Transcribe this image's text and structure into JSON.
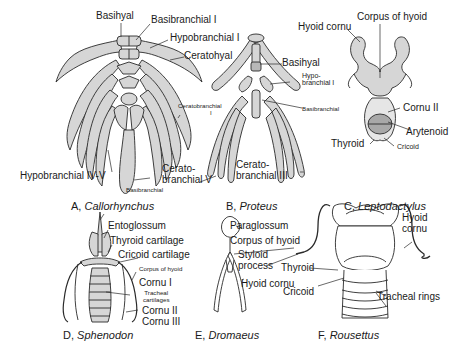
{
  "figure": {
    "panels": [
      {
        "id": "A",
        "letter": "A,",
        "taxon": "Callorhynchus",
        "labels": {
          "basihyal": "Basihyal",
          "basibranchial_i": "Basibranchial I",
          "hypobranchial_i": "Hypobranchial I",
          "ceratohyal": "Ceratohyal",
          "ceratobranchial_i_1": "Ceratobranchial",
          "ceratobranchial_i_2": "I",
          "hypobranchial_iv_v": "Hypobranchial IV-V",
          "ceratobranchial_v_1": "Cerato-",
          "ceratobranchial_v_2": "branchial V",
          "basibranchial": "Basibranchial"
        }
      },
      {
        "id": "B",
        "letter": "B,",
        "taxon": "Proteus",
        "labels": {
          "basihyal": "Basihyal",
          "hypobranchial_i_1": "Hypo-",
          "hypobranchial_i_2": "branchial I",
          "basibranchial": "Basibranchial",
          "ceratobranchial_iii_1": "Cerato-",
          "ceratobranchial_iii_2": "branchial III"
        }
      },
      {
        "id": "C",
        "letter": "C,",
        "taxon": "Leptodactylus",
        "labels": {
          "hyoid_cornu": "Hyoid cornu",
          "corpus_of_hyoid": "Corpus of hyoid",
          "cornu_ii": "Cornu II",
          "arytenoid": "Arytenoid",
          "thyroid": "Thyroid",
          "cricoid": "Cricoid"
        }
      },
      {
        "id": "D",
        "letter": "D,",
        "taxon": "Sphenodon",
        "labels": {
          "entoglossum": "Entoglossum",
          "thyroid_cartilage": "Thyroid cartilage",
          "cricoid_cartilage": "Cricoid cartilage",
          "corpus_of_hyoid": "Corpus of hyoid",
          "cornu_i": "Cornu I",
          "tracheal_cartilages_1": "Tracheal",
          "tracheal_cartilages_2": "cartilages",
          "cornu_ii": "Cornu II",
          "cornu_iii": "Cornu III"
        }
      },
      {
        "id": "E",
        "letter": "E,",
        "taxon": "Dromaeus",
        "labels": {
          "paraglossum": "Paraglossum",
          "corpus_of_hyoid": "Corpus of hyoid",
          "styloid_process_1": "Styloid",
          "styloid_process_2": "process",
          "hyoid_cornu": "Hyoid cornu"
        }
      },
      {
        "id": "F",
        "letter": "F,",
        "taxon": "Rousettus",
        "labels": {
          "hyoid_cornu_1": "Hyoid",
          "hyoid_cornu_2": "cornu",
          "thyroid": "Thyroid",
          "cricoid": "Cricoid",
          "tracheal_rings": "Tracheal rings"
        }
      }
    ],
    "colors": {
      "line": "#2a2a2a",
      "fill": "#d6d6d6",
      "fill_dark": "#b8b8b8",
      "background": "#ffffff"
    }
  }
}
